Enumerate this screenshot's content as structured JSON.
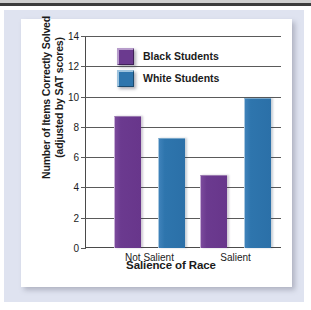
{
  "chart_data": {
    "type": "bar",
    "title": "",
    "xlabel": "Salience of Race",
    "ylabel_line1": "Number of Items Correctly Solved",
    "ylabel_line2": "(adjusted by SAT scores)",
    "categories": [
      "Not Salient",
      "Salient"
    ],
    "series": [
      {
        "name": "Black Students",
        "color": "#6b3a8f",
        "values": [
          8.7,
          4.8
        ]
      },
      {
        "name": "White Students",
        "color": "#2e75ad",
        "values": [
          7.25,
          9.9
        ]
      }
    ],
    "ylim": [
      0,
      14
    ],
    "yticks": [
      0,
      2,
      4,
      6,
      8,
      10,
      12,
      14
    ],
    "ytick_labels": [
      "0",
      "2",
      "4",
      "6",
      "8",
      "10",
      "12",
      "14"
    ],
    "grid": true,
    "legend_position": "top-left-inside"
  },
  "legend": {
    "items": [
      {
        "label": "Black Students",
        "swatch": "purple-swatch"
      },
      {
        "label": "White Students",
        "swatch": "blue-swatch"
      }
    ]
  },
  "colors": {
    "purple": "#6b3a8f",
    "blue": "#2e75ad",
    "panel": "#dfe3f0",
    "card": "#ffffff",
    "axis": "#4a4a4a",
    "text": "#1b1b1b"
  }
}
